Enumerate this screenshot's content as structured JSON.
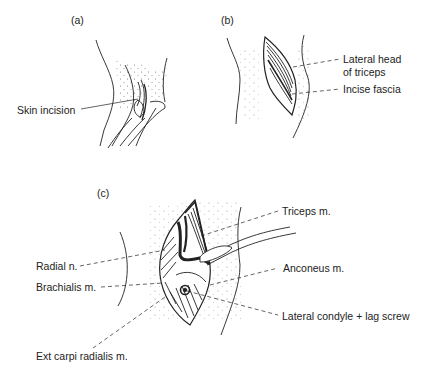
{
  "figure": {
    "panels": [
      {
        "id": "a",
        "label": "(a)",
        "annotations": [
          "Skin incision"
        ]
      },
      {
        "id": "b",
        "label": "(b)",
        "annotations": [
          "Lateral head",
          "of triceps",
          "Incise fascia"
        ]
      },
      {
        "id": "c",
        "label": "(c)",
        "annotations": [
          "Triceps m.",
          "Radial n.",
          "Anconeus m.",
          "Brachialis m.",
          "Lateral condyle + lag screw",
          "Ext carpi radialis m."
        ]
      }
    ]
  },
  "a": {
    "panel_label": "(a)",
    "skin_incision": "Skin incision"
  },
  "b": {
    "panel_label": "(b)",
    "lateral_head_1": "Lateral head",
    "lateral_head_2": "of triceps",
    "incise_fascia": "Incise fascia"
  },
  "c": {
    "panel_label": "(c)",
    "triceps": "Triceps m.",
    "radial_n": "Radial n.",
    "anconeus": "Anconeus m.",
    "brachialis": "Brachialis m.",
    "lateral_condyle": "Lateral condyle + lag screw",
    "ext_carpi": "Ext carpi radialis m."
  },
  "colors": {
    "ink": "#222222",
    "background": "#ffffff"
  }
}
